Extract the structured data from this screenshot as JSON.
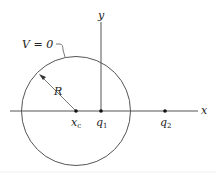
{
  "figure": {
    "colors": {
      "stroke": "#555555",
      "text": "#222222",
      "background": "#ffffff"
    }
  },
  "axes": {
    "x_label": "x",
    "y_label": "y"
  },
  "circle": {
    "potential_label": "V = 0",
    "radius_label": "R",
    "center_label_main": "x",
    "center_label_sub": "c"
  },
  "charges": [
    {
      "label_main": "q",
      "label_sub": "1"
    },
    {
      "label_main": "q",
      "label_sub": "2"
    }
  ]
}
